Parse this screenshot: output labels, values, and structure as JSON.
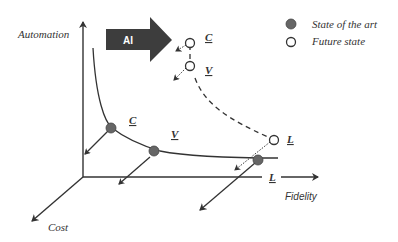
{
  "diagram": {
    "axes": {
      "y_label": "Automation",
      "x_label": "Fidelity",
      "z_label": "Cost"
    },
    "ai_arrow": {
      "label": "AI",
      "color": "#3d3d3d"
    },
    "legend": {
      "items": [
        {
          "label": "State of the art",
          "marker": "filled-circle",
          "color": "#666666"
        },
        {
          "label": "Future state",
          "marker": "open-circle",
          "color": "#ffffff"
        }
      ]
    },
    "points": {
      "state_of_art": [
        {
          "label": "C"
        },
        {
          "label": "V"
        },
        {
          "label": "L"
        }
      ],
      "future_state": [
        {
          "label": "C"
        },
        {
          "label": "V"
        },
        {
          "label": "L"
        }
      ]
    },
    "colors": {
      "line": "#333333",
      "filled_point": "#666666",
      "ai_arrow": "#3d3d3d"
    }
  }
}
